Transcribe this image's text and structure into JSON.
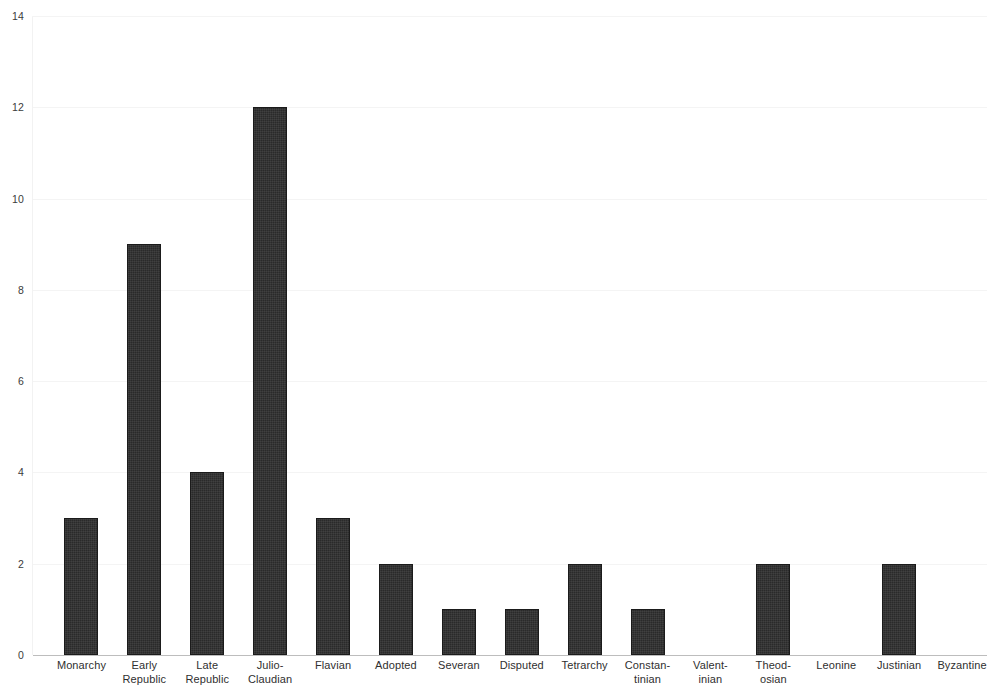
{
  "chart_data": {
    "type": "bar",
    "title": "",
    "subtitle": "",
    "xlabel": "",
    "ylabel": "",
    "ylim": [
      0,
      14
    ],
    "xlim": null,
    "grid": true,
    "legend": null,
    "legend_position": "none",
    "yticks": [
      0,
      2,
      4,
      6,
      8,
      10,
      12,
      14
    ],
    "ytick_labels": [
      "0",
      "2",
      "4",
      "6",
      "8",
      "10",
      "12",
      "14"
    ],
    "bar_color": "#2a2a2a",
    "background_color": "#ffffff",
    "gridline_color": "#f4f4f4",
    "axis_color": "#bdbdbd",
    "categories": [
      "Monarchy",
      "Early\nRepublic",
      "Late\nRepublic",
      "Julio-\nClaudian",
      "Flavian",
      "Adopted",
      "Severan",
      "Disputed",
      "Tetrarchy",
      "Constan-\ntinian",
      "Valent-\ninian",
      "Theod-\nosian",
      "Leonine",
      "Justinian",
      "Byzantine"
    ],
    "values": [
      3,
      9,
      4,
      12,
      3,
      2,
      1,
      1,
      2,
      1,
      0,
      2,
      0,
      2,
      0
    ]
  }
}
